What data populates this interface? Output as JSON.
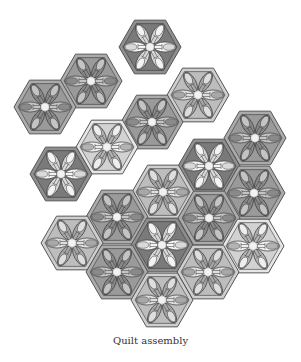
{
  "figure": {
    "caption": "Quilt assembly",
    "hex_radius": 31,
    "colors": {
      "outline": "#555555",
      "stroke": "#3a3a3a",
      "center": "#f2f2f2"
    },
    "palette": {
      "dark": {
        "fill": "#8e8e8e",
        "inner": "#7a7a7a",
        "petal": "#d9d9d9",
        "tip": "#f4f4f4"
      },
      "grey": {
        "fill": "#ababab",
        "inner": "#9a9a9a",
        "petal": "#8a8a8a",
        "tip": "#c4c4c4"
      },
      "medium": {
        "fill": "#a3a3a3",
        "inner": "#8f8f8f",
        "petal": "#c9c9c9",
        "tip": "#e9e9e9"
      },
      "light": {
        "fill": "#cfcfcf",
        "inner": "#bdbdbd",
        "petal": "#a8a8a8",
        "tip": "#dedede"
      },
      "verylight": {
        "fill": "#e6e6e6",
        "inner": "#d2d2d2",
        "petal": "#b3b3b3",
        "tip": "#eeeeee"
      }
    },
    "hexagons": [
      {
        "x": 150,
        "y": 47,
        "tone": "dark"
      },
      {
        "x": 91,
        "y": 81,
        "tone": "grey"
      },
      {
        "x": 45,
        "y": 107,
        "tone": "grey"
      },
      {
        "x": 198,
        "y": 95,
        "tone": "light"
      },
      {
        "x": 152,
        "y": 122,
        "tone": "grey"
      },
      {
        "x": 107,
        "y": 147,
        "tone": "verylight"
      },
      {
        "x": 61,
        "y": 174,
        "tone": "dark"
      },
      {
        "x": 255,
        "y": 138,
        "tone": "grey"
      },
      {
        "x": 209,
        "y": 166,
        "tone": "dark"
      },
      {
        "x": 163,
        "y": 192,
        "tone": "light"
      },
      {
        "x": 254,
        "y": 193,
        "tone": "grey"
      },
      {
        "x": 117,
        "y": 217,
        "tone": "grey"
      },
      {
        "x": 209,
        "y": 218,
        "tone": "grey"
      },
      {
        "x": 72,
        "y": 243,
        "tone": "light"
      },
      {
        "x": 162,
        "y": 245,
        "tone": "dark"
      },
      {
        "x": 253,
        "y": 246,
        "tone": "verylight"
      },
      {
        "x": 117,
        "y": 272,
        "tone": "grey"
      },
      {
        "x": 208,
        "y": 272,
        "tone": "light"
      },
      {
        "x": 162,
        "y": 300,
        "tone": "light"
      }
    ]
  }
}
